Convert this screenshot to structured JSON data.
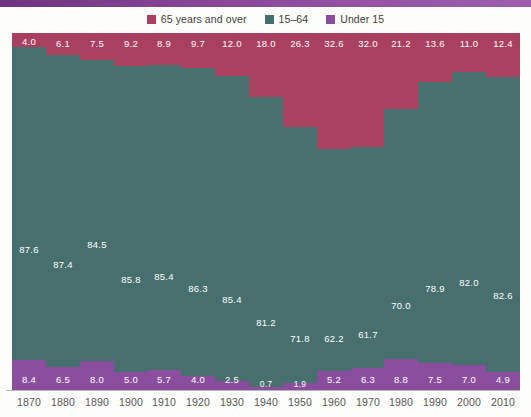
{
  "theme": {
    "background": "#fdfdfb",
    "band_color": "#8a4a9c",
    "axis_color": "#b9b3ba",
    "label_color": "#575757",
    "color_65_over": "#a9405f",
    "color_15_64": "#466f6e",
    "color_under_15": "#8b4e9e"
  },
  "legend": {
    "items": [
      {
        "label": "65 years and over",
        "color": "#a9405f",
        "swatch_name": "legend-swatch-65-over"
      },
      {
        "label": "15–64",
        "color": "#466f6e",
        "swatch_name": "legend-swatch-15-64"
      },
      {
        "label": "Under 15",
        "color": "#8b4e9e",
        "swatch_name": "legend-swatch-under-15"
      }
    ]
  },
  "chart_data": {
    "type": "bar",
    "subtype": "stacked-100-percent",
    "title": "",
    "subtitle": "",
    "xlabel": "",
    "ylabel": "",
    "ylim": [
      0,
      100
    ],
    "grid": false,
    "legend_position": "top-center",
    "categories": [
      "1870",
      "1880",
      "1890",
      "1900",
      "1910",
      "1920",
      "1930",
      "1940",
      "1950",
      "1960",
      "1970",
      "1980",
      "1990",
      "2000",
      "2010"
    ],
    "series": [
      {
        "name": "65 years and over",
        "color": "#a9405f",
        "values": [
          4.0,
          6.1,
          7.5,
          9.2,
          8.9,
          9.7,
          12.0,
          18.0,
          26.3,
          32.6,
          32.0,
          21.2,
          13.6,
          11.0,
          12.4
        ],
        "labels": [
          "4.0",
          "6.1",
          "7.5",
          "9.2",
          "8.9",
          "9.7",
          "12.0",
          "18.0",
          "26.3",
          "32.6",
          "32.0",
          "21.2",
          "13.6",
          "11.0",
          "12.4"
        ]
      },
      {
        "name": "15–64",
        "color": "#466f6e",
        "values": [
          87.6,
          87.4,
          84.5,
          85.8,
          85.4,
          86.3,
          85.4,
          81.2,
          71.8,
          62.2,
          61.7,
          70.0,
          78.9,
          82.0,
          82.6
        ],
        "labels": [
          "87.6",
          "87.4",
          "84.5",
          "85.8",
          "85.4",
          "86.3",
          "85.4",
          "81.2",
          "71.8",
          "62.2",
          "61.7",
          "70.0",
          "78.9",
          "82.0",
          "82.6"
        ]
      },
      {
        "name": "Under 15",
        "color": "#8b4e9e",
        "values": [
          8.4,
          6.5,
          8.0,
          5.0,
          5.7,
          4.0,
          2.5,
          0.7,
          1.9,
          5.2,
          6.3,
          8.8,
          7.5,
          7.0,
          4.9
        ],
        "labels": [
          "8.4",
          "6.5",
          "8.0",
          "5.0",
          "5.7",
          "4.0",
          "2.5",
          "0.7",
          "1.9",
          "5.2",
          "6.3",
          "8.8",
          "7.5",
          "7.0",
          "4.9"
        ]
      }
    ]
  }
}
